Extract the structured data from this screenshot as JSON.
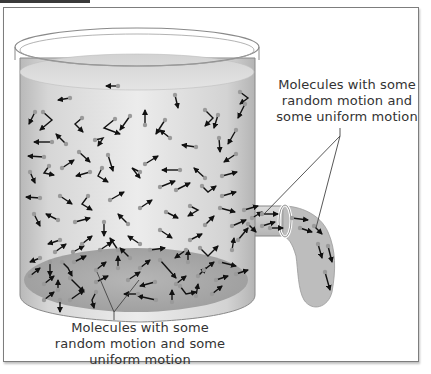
{
  "figure": {
    "type": "diagram",
    "colors": {
      "frame_border": "#7d7d7d",
      "liquid_light": "#d8d8d8",
      "liquid_dark": "#a8a8a8",
      "molecule_head": "#9a9a9a",
      "arrow": "#111111",
      "label_text": "#333333",
      "leader_line": "#444444"
    }
  },
  "labels": {
    "right_callout": {
      "lines": [
        "Molecules with some",
        "random motion and",
        "some uniform motion"
      ]
    },
    "bottom_callout": {
      "lines": [
        "Molecules with some",
        "random motion and some",
        "uniform motion"
      ]
    }
  }
}
